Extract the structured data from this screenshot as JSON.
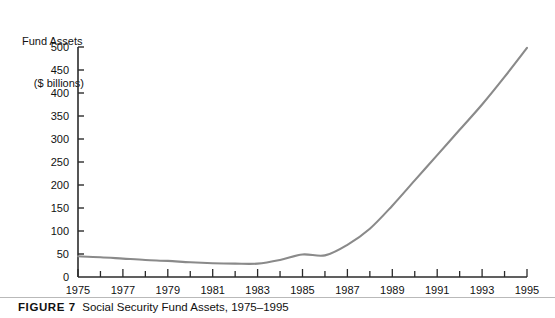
{
  "figure": {
    "label": "FIGURE 7",
    "caption": "Social Security Fund Assets, 1975–1995"
  },
  "axis_title": {
    "line1": "Fund Assets",
    "line2": "($ billions)"
  },
  "colors": {
    "line": "#8a8a8a",
    "axis": "#2b2b2b",
    "text": "#111111",
    "rule": "#b9b9b9",
    "background": "#ffffff"
  },
  "chart_data": {
    "type": "line",
    "title": "Social Security Fund Assets, 1975–1995",
    "xlabel": "",
    "ylabel": "Fund Assets ($ billions)",
    "xlim": [
      1975,
      1995
    ],
    "ylim": [
      0,
      500
    ],
    "grid": false,
    "legend": null,
    "y_ticks": [
      0,
      50,
      100,
      150,
      200,
      250,
      300,
      350,
      400,
      450,
      500
    ],
    "y_tick_labels": [
      "0",
      "50",
      "100",
      "150",
      "200",
      "250",
      "300",
      "350",
      "400",
      "450",
      "500"
    ],
    "x_ticks": [
      1975,
      1976,
      1977,
      1978,
      1979,
      1980,
      1981,
      1982,
      1983,
      1984,
      1985,
      1986,
      1987,
      1988,
      1989,
      1990,
      1991,
      1992,
      1993,
      1994,
      1995
    ],
    "x_tick_labels_shown": [
      "1975",
      "1977",
      "1979",
      "1981",
      "1983",
      "1985",
      "1987",
      "1989",
      "1991",
      "1993",
      "1995"
    ],
    "x": [
      1975,
      1976,
      1977,
      1978,
      1979,
      1980,
      1981,
      1982,
      1983,
      1984,
      1985,
      1986,
      1987,
      1988,
      1989,
      1990,
      1991,
      1992,
      1993,
      1994,
      1995
    ],
    "values": [
      45,
      43,
      40,
      37,
      35,
      32,
      30,
      29,
      29,
      37,
      49,
      47,
      70,
      105,
      155,
      210,
      265,
      320,
      375,
      435,
      498
    ],
    "series": [
      {
        "name": "Social Security Fund Assets",
        "values": [
          45,
          43,
          40,
          37,
          35,
          32,
          30,
          29,
          29,
          37,
          49,
          47,
          70,
          105,
          155,
          210,
          265,
          320,
          375,
          435,
          498
        ]
      }
    ]
  }
}
